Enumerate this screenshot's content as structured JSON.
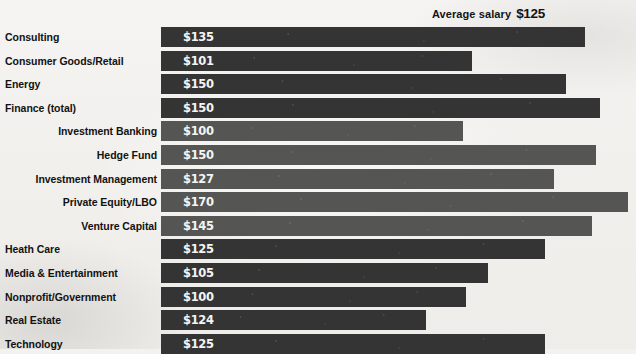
{
  "header": {
    "label": "Average salary",
    "value": "$125"
  },
  "chart_data": {
    "type": "bar",
    "orientation": "horizontal",
    "xlabel": "",
    "ylabel": "",
    "xlim": [
      100,
      170
    ],
    "grid": false,
    "legend": null,
    "value_prefix": "$",
    "units": "thousands USD",
    "categories": [
      "Consulting",
      "Consumer Goods/Retail",
      "Energy",
      "Finance (total)",
      "Investment Banking",
      "Hedge Fund",
      "Investment Management",
      "Private Equity/LBO",
      "Venture Capital",
      "Heath Care",
      "Media & Entertainment",
      "Nonprofit/Government",
      "Real Estate",
      "Technology"
    ],
    "values": [
      135,
      101,
      150,
      150,
      100,
      150,
      127,
      170,
      145,
      125,
      105,
      100,
      124,
      125
    ],
    "rows": [
      {
        "label": "Consulting",
        "value": 135,
        "value_text": "$135",
        "level": 0,
        "bar_px": 424
      },
      {
        "label": "Consumer Goods/Retail",
        "value": 101,
        "value_text": "$101",
        "level": 0,
        "bar_px": 311
      },
      {
        "label": "Energy",
        "value": 150,
        "value_text": "$150",
        "level": 0,
        "bar_px": 405
      },
      {
        "label": "Finance (total)",
        "value": 150,
        "value_text": "$150",
        "level": 0,
        "bar_px": 439
      },
      {
        "label": "Investment Banking",
        "value": 100,
        "value_text": "$100",
        "level": 1,
        "bar_px": 302
      },
      {
        "label": "Hedge Fund",
        "value": 150,
        "value_text": "$150",
        "level": 1,
        "bar_px": 435
      },
      {
        "label": "Investment Management",
        "value": 127,
        "value_text": "$127",
        "level": 1,
        "bar_px": 393
      },
      {
        "label": "Private Equity/LBO",
        "value": 170,
        "value_text": "$170",
        "level": 1,
        "bar_px": 467
      },
      {
        "label": "Venture Capital",
        "value": 145,
        "value_text": "$145",
        "level": 1,
        "bar_px": 431
      },
      {
        "label": "Heath Care",
        "value": 125,
        "value_text": "$125",
        "level": 0,
        "bar_px": 384
      },
      {
        "label": "Media & Entertainment",
        "value": 105,
        "value_text": "$105",
        "level": 0,
        "bar_px": 327
      },
      {
        "label": "Nonprofit/Government",
        "value": 100,
        "value_text": "$100",
        "level": 0,
        "bar_px": 305
      },
      {
        "label": "Real Estate",
        "value": 124,
        "value_text": "$124",
        "level": 0,
        "bar_px": 265
      },
      {
        "label": "Technology",
        "value": 125,
        "value_text": "$125",
        "level": 0,
        "bar_px": 384
      }
    ]
  },
  "colors": {
    "bar_main": "#343434",
    "bar_sub": "#555554",
    "background": "#f3f2f0",
    "label_text": "#121212",
    "value_text": "#f4f4f2"
  },
  "layout": {
    "first_row_top": 27,
    "row_pitch": 23.6,
    "bar_height": 20,
    "bar_left": 161
  }
}
